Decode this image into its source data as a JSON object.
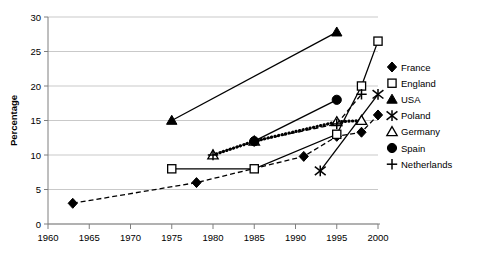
{
  "chart_data": {
    "type": "line",
    "title": "",
    "xlabel": "",
    "ylabel": "Percentage",
    "xlim": [
      1960,
      2000
    ],
    "ylim": [
      0,
      30
    ],
    "xticks": [
      1960,
      1965,
      1970,
      1975,
      1980,
      1985,
      1990,
      1995,
      2000
    ],
    "yticks": [
      0,
      5,
      10,
      15,
      20,
      25,
      30
    ],
    "grid": "horizontal",
    "legend_position": "right",
    "series": [
      {
        "name": "France",
        "marker": "filled-diamond",
        "linestyle": "dashed",
        "color": "#000000",
        "points": [
          {
            "x": 1963,
            "y": 3
          },
          {
            "x": 1978,
            "y": 6
          },
          {
            "x": 1991,
            "y": 9.8
          },
          {
            "x": 1995,
            "y": 12.7
          },
          {
            "x": 1998,
            "y": 13.3
          },
          {
            "x": 2000,
            "y": 15.8
          }
        ]
      },
      {
        "name": "England",
        "marker": "open-square",
        "linestyle": "solid",
        "color": "#000000",
        "points": [
          {
            "x": 1975,
            "y": 8
          },
          {
            "x": 1985,
            "y": 8
          },
          {
            "x": 1995,
            "y": 13
          },
          {
            "x": 1998,
            "y": 20
          },
          {
            "x": 2000,
            "y": 26.5
          }
        ]
      },
      {
        "name": "USA",
        "marker": "filled-triangle",
        "linestyle": "solid",
        "color": "#000000",
        "points": [
          {
            "x": 1975,
            "y": 15
          },
          {
            "x": 1995,
            "y": 27.8
          }
        ]
      },
      {
        "name": "Poland",
        "marker": "asterisk",
        "linestyle": "solid",
        "color": "#000000",
        "points": [
          {
            "x": 1993,
            "y": 7.7
          },
          {
            "x": 2000,
            "y": 18.8
          }
        ]
      },
      {
        "name": "Germany",
        "marker": "open-triangle",
        "linestyle": "dotted",
        "color": "#000000",
        "points": [
          {
            "x": 1980,
            "y": 10
          },
          {
            "x": 1985,
            "y": 12
          },
          {
            "x": 1995,
            "y": 14.8
          },
          {
            "x": 1998,
            "y": 15
          }
        ]
      },
      {
        "name": "Spain",
        "marker": "filled-circle",
        "linestyle": "solid",
        "color": "#000000",
        "points": [
          {
            "x": 1985,
            "y": 12
          },
          {
            "x": 1995,
            "y": 18
          }
        ]
      },
      {
        "name": "Netherlands",
        "marker": "plus",
        "linestyle": "dashed",
        "color": "#000000",
        "points": [
          {
            "x": 1980,
            "y": 10
          },
          {
            "x": 1985,
            "y": 12
          },
          {
            "x": 1995,
            "y": 14.5
          },
          {
            "x": 1998,
            "y": 18.8
          }
        ]
      }
    ]
  }
}
